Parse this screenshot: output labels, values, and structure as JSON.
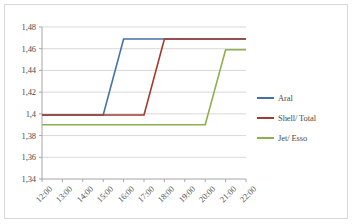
{
  "chart_data": {
    "type": "line",
    "title": "",
    "xlabel": "",
    "ylabel": "",
    "grid": true,
    "legend_position": "right",
    "x": [
      "12:00",
      "13:00",
      "14:00",
      "15:00",
      "16:00",
      "17:00",
      "18:00",
      "19:00",
      "20:00",
      "21:00",
      "22:00"
    ],
    "ylim": [
      1.34,
      1.48
    ],
    "yticks": [
      1.34,
      1.36,
      1.38,
      1.4,
      1.42,
      1.44,
      1.46,
      1.48
    ],
    "ytick_labels": [
      "1,34",
      "1,36",
      "1,38",
      "1,4",
      "1,42",
      "1,44",
      "1,46",
      "1,48"
    ],
    "series": [
      {
        "name": "Aral",
        "color": "#4472a8",
        "values": [
          1.399,
          1.399,
          1.399,
          1.399,
          1.469,
          1.469,
          1.469,
          1.469,
          1.469,
          1.469,
          1.469
        ]
      },
      {
        "name": "Shell/ Total",
        "color": "#a33a2e",
        "values": [
          1.399,
          1.399,
          1.399,
          1.399,
          1.399,
          1.399,
          1.469,
          1.469,
          1.469,
          1.469,
          1.469
        ]
      },
      {
        "name": "Jet/ Esso",
        "color": "#8db04e",
        "values": [
          1.39,
          1.39,
          1.39,
          1.39,
          1.39,
          1.39,
          1.39,
          1.39,
          1.39,
          1.459,
          1.459
        ]
      }
    ]
  },
  "legend": {
    "entries": [
      {
        "label": "Aral",
        "color": "#4472a8"
      },
      {
        "label": "Shell/ Total",
        "color": "#a33a2e"
      },
      {
        "label": "Jet/ Esso",
        "color": "#8db04e"
      }
    ]
  },
  "axes": {
    "y_tick_labels": [
      "1,48",
      "1,46",
      "1,44",
      "1,42",
      "1,4",
      "1,38",
      "1,36",
      "1,34"
    ],
    "x_tick_labels": [
      "12:00",
      "13:00",
      "14:00",
      "15:00",
      "16:00",
      "17:00",
      "18:00",
      "19:00",
      "20:00",
      "21:00",
      "22:00"
    ]
  }
}
